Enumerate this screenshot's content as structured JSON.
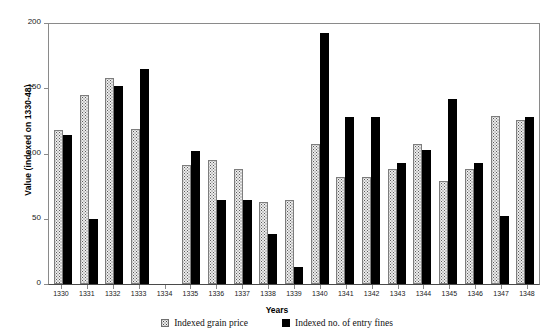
{
  "chart_data": {
    "type": "bar",
    "title": "",
    "xlabel": "Years",
    "ylabel": "Value (indexed on 1330-48)",
    "ylim": [
      0,
      200
    ],
    "yticks": [
      0,
      50,
      100,
      150,
      200
    ],
    "grid": false,
    "legend_position": "bottom",
    "categories": [
      "1330",
      "1331",
      "1332",
      "1333",
      "1334",
      "1335",
      "1336",
      "1337",
      "1338",
      "1339",
      "1340",
      "1341",
      "1342",
      "1343",
      "1344",
      "1345",
      "1346",
      "1347",
      "1348"
    ],
    "series": [
      {
        "name": "Indexed grain price",
        "color": "#ececec",
        "pattern": "dotted",
        "values": [
          118,
          145,
          158,
          119,
          null,
          91,
          95,
          88,
          63,
          64,
          107,
          82,
          82,
          88,
          107,
          79,
          88,
          129,
          126
        ]
      },
      {
        "name": "Indexed no. of entry fines",
        "color": "#000000",
        "pattern": "solid",
        "values": [
          114,
          50,
          152,
          165,
          null,
          102,
          64,
          64,
          38,
          13,
          192,
          128,
          128,
          93,
          103,
          142,
          93,
          52,
          128
        ]
      }
    ]
  },
  "legend": {
    "items": [
      {
        "label": "Indexed grain price",
        "swatch": "grain"
      },
      {
        "label": "Indexed no. of entry fines",
        "swatch": "fines"
      }
    ]
  }
}
